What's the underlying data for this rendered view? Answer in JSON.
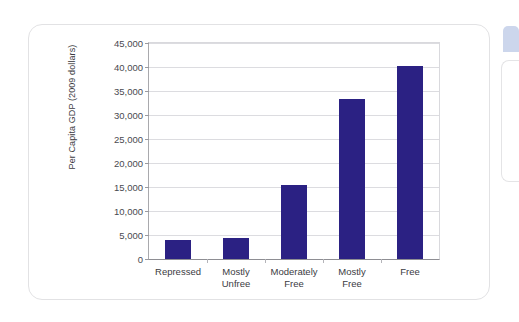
{
  "chart_data": {
    "type": "bar",
    "title": "",
    "subtitle": "",
    "xlabel": "",
    "ylabel": "Per Capita GDP (2009 dollars)",
    "categories": [
      "Repressed",
      "Mostly\nUnfree",
      "Moderately\nFree",
      "Mostly\nFree",
      "Free"
    ],
    "category_lines": [
      [
        "Repressed"
      ],
      [
        "Mostly",
        "Unfree"
      ],
      [
        "Moderately",
        "Free"
      ],
      [
        "Mostly",
        "Free"
      ],
      [
        "Free"
      ]
    ],
    "values": [
      3900,
      4300,
      15400,
      33400,
      40300
    ],
    "ylim": [
      0,
      45000
    ],
    "ytick_values": [
      0,
      5000,
      10000,
      15000,
      20000,
      25000,
      30000,
      35000,
      40000,
      45000
    ],
    "ytick_labels": [
      "0",
      "5,000",
      "10,000",
      "15,000",
      "20,000",
      "25,000",
      "30,000",
      "35,000",
      "40,000",
      "45,000"
    ],
    "grid": true,
    "legend": false,
    "legend_position": "none",
    "bar_color": "#2b2183",
    "gridline_color": "#dcdce0",
    "axis_color": "#8e8e93",
    "plot_background": "#ffffff"
  },
  "page": {
    "background_color": "#ffffff",
    "card_border_color": "#e2e2e4",
    "side_tab_color": "#ccd6ec"
  }
}
